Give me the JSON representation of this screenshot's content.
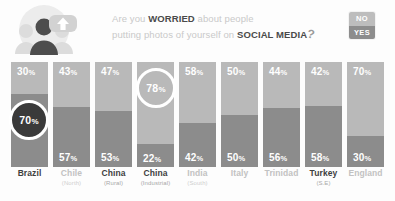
{
  "header": {
    "line1_pre": "Are you ",
    "line1_strong": "WORRIED",
    "line1_post": " about people",
    "line2_pre": "putting photos of yourself on ",
    "line2_strong": "SOCIAL MEDIA",
    "question_mark": "?",
    "avatar_icon": "people-group-icon",
    "upload_icon": "upload-arrow-icon"
  },
  "legend": {
    "no_label": "NO",
    "yes_label": "YES",
    "no_color": "#bdbdbd",
    "yes_color": "#8d8d8d"
  },
  "chart_data": {
    "type": "bar",
    "stacked": true,
    "unit": "%",
    "ylim": [
      0,
      100
    ],
    "grid": false,
    "legend_position": "top-right",
    "categories": [
      "Brazil",
      "Chile (North)",
      "China (Rural)",
      "China (Industrial)",
      "India (South)",
      "Italy",
      "Trinidad",
      "Turkey (S.E)",
      "England"
    ],
    "series": [
      {
        "name": "NO",
        "values": [
          30,
          43,
          47,
          78,
          58,
          50,
          44,
          42,
          70
        ]
      },
      {
        "name": "YES",
        "values": [
          70,
          57,
          53,
          22,
          42,
          50,
          56,
          58,
          30
        ]
      }
    ]
  },
  "columns": [
    {
      "name": "Brazil",
      "sub": "",
      "emphasis": true,
      "no": "30%",
      "no_num": 30,
      "no_show": true,
      "yes": "70%",
      "yes_num": 70,
      "yes_show": false,
      "highlight": {
        "value": "70%",
        "style": "filled",
        "segment": "yes"
      }
    },
    {
      "name": "Chile",
      "sub": "(North)",
      "emphasis": false,
      "no": "43%",
      "no_num": 43,
      "no_show": true,
      "yes": "57%",
      "yes_num": 57,
      "yes_show": true,
      "highlight": null
    },
    {
      "name": "China",
      "sub": "(Rural)",
      "emphasis": true,
      "no": "47%",
      "no_num": 47,
      "no_show": true,
      "yes": "53%",
      "yes_num": 53,
      "yes_show": true,
      "highlight": null
    },
    {
      "name": "China",
      "sub": "(Industrial)",
      "emphasis": true,
      "no": "78%",
      "no_num": 78,
      "no_show": false,
      "yes": "22%",
      "yes_num": 22,
      "yes_show": true,
      "highlight": {
        "value": "78%",
        "style": "ring",
        "segment": "no"
      }
    },
    {
      "name": "India",
      "sub": "(South)",
      "emphasis": false,
      "no": "58%",
      "no_num": 58,
      "no_show": true,
      "yes": "42%",
      "yes_num": 42,
      "yes_show": true,
      "highlight": null
    },
    {
      "name": "Italy",
      "sub": "",
      "emphasis": false,
      "no": "50%",
      "no_num": 50,
      "no_show": true,
      "yes": "50%",
      "yes_num": 50,
      "yes_show": true,
      "highlight": null
    },
    {
      "name": "Trinidad",
      "sub": "",
      "emphasis": false,
      "no": "44%",
      "no_num": 44,
      "no_show": true,
      "yes": "56%",
      "yes_num": 56,
      "yes_show": true,
      "highlight": null
    },
    {
      "name": "Turkey",
      "sub": "(S.E)",
      "emphasis": true,
      "no": "42%",
      "no_num": 42,
      "no_show": true,
      "yes": "58%",
      "yes_num": 58,
      "yes_show": true,
      "highlight": null
    },
    {
      "name": "England",
      "sub": "",
      "emphasis": false,
      "no": "70%",
      "no_num": 70,
      "no_show": true,
      "yes": "30%",
      "yes_num": 30,
      "yes_show": true,
      "highlight": null
    }
  ]
}
